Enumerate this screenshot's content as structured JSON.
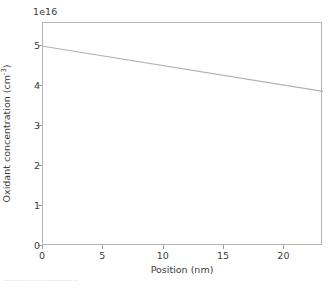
{
  "chart_data": {
    "type": "line",
    "title": "",
    "xlabel": "Position (nm)",
    "ylabel": "Oxidant concentration (cm",
    "ylabel_sup": "-3",
    "ylabel_suffix": ")",
    "offset_text": "1e16",
    "xlim": [
      0,
      23.2
    ],
    "ylim": [
      0,
      5.58
    ],
    "xticks": [
      0,
      5,
      10,
      15,
      20
    ],
    "xticklabels": [
      "0",
      "5",
      "10",
      "15",
      "20"
    ],
    "yticks": [
      0,
      1,
      2,
      3,
      4,
      5
    ],
    "yticklabels": [
      "0",
      "1",
      "2",
      "3",
      "4",
      "5"
    ],
    "grid": false,
    "legend": false,
    "series": [
      {
        "name": "oxidant concentration",
        "color": "#b0b0b0",
        "x": [
          0,
          23.2
        ],
        "values": [
          5.0,
          3.87
        ]
      }
    ],
    "y_scale_note": "values are in units of 1e16 cm^-3"
  },
  "figure": {
    "background_color": "#ffffff",
    "frame_color": "#b6b6b6",
    "text_color": "#3c3c3c"
  },
  "bottom_strip": {
    "text": "............................."
  }
}
